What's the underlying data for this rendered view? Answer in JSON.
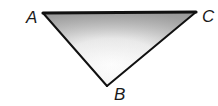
{
  "diagram": {
    "type": "triangle",
    "vertices": [
      {
        "id": "A",
        "label": "A"
      },
      {
        "id": "B",
        "label": "B"
      },
      {
        "id": "C",
        "label": "C"
      }
    ],
    "edges": [
      "AB",
      "BC",
      "CA"
    ],
    "fill": "gray-gradient",
    "colors": {
      "stroke": "#111111",
      "fill_dark": "#8f8f8f",
      "fill_light": "#ffffff"
    }
  }
}
